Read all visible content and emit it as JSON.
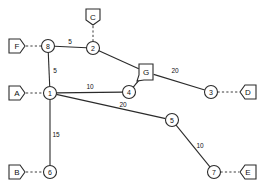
{
  "diagram": {
    "colors": {
      "background": "#ffffff",
      "edge": "#2b2b2b",
      "stub": "#3a3a3a",
      "node_fill": "#ffffff",
      "text": "#111111"
    },
    "nodes": [
      {
        "id": "n1",
        "label": "1",
        "x": 50,
        "y": 93,
        "r": 6.5
      },
      {
        "id": "n2",
        "label": "2",
        "x": 93,
        "y": 48,
        "r": 6.5
      },
      {
        "id": "n3",
        "label": "3",
        "x": 211,
        "y": 92,
        "r": 6.5
      },
      {
        "id": "n4",
        "label": "4",
        "x": 129,
        "y": 92,
        "r": 6.5
      },
      {
        "id": "n5",
        "label": "5",
        "x": 172,
        "y": 120,
        "r": 6.5
      },
      {
        "id": "n6",
        "label": "6",
        "x": 50,
        "y": 172,
        "r": 6.5
      },
      {
        "id": "n7",
        "label": "7",
        "x": 214,
        "y": 172,
        "r": 6.5
      },
      {
        "id": "n8",
        "label": "8",
        "x": 48,
        "y": 46,
        "r": 6.5
      }
    ],
    "terminals": [
      {
        "id": "tA",
        "label": "A",
        "x": 17,
        "y": 93,
        "orientation": "right",
        "attached_node": "n1"
      },
      {
        "id": "tB",
        "label": "B",
        "x": 17,
        "y": 172,
        "orientation": "right",
        "attached_node": "n6"
      },
      {
        "id": "tC",
        "label": "C",
        "x": 93,
        "y": 17,
        "orientation": "down",
        "attached_node": "n2"
      },
      {
        "id": "tD",
        "label": "D",
        "x": 248,
        "y": 92,
        "orientation": "left",
        "attached_node": "n3"
      },
      {
        "id": "tE",
        "label": "E",
        "x": 248,
        "y": 172,
        "orientation": "left",
        "attached_node": "n7"
      },
      {
        "id": "tF",
        "label": "F",
        "x": 17,
        "y": 46,
        "orientation": "right",
        "attached_node": "n8"
      },
      {
        "id": "tG",
        "label": "G",
        "x": 146,
        "y": 72,
        "orientation": "downleft",
        "attached_node": "n4"
      }
    ],
    "edges": [
      {
        "id": "e8-2",
        "from": "n8",
        "to": "n2",
        "weight": "5",
        "label_x": 70,
        "label_y": 41
      },
      {
        "id": "e8-1",
        "from": "n8",
        "to": "n1",
        "weight": "5",
        "label_x": 55,
        "label_y": 70
      },
      {
        "id": "e2-G",
        "from": "n2",
        "to": "tG",
        "weight": "",
        "label_x": 0,
        "label_y": 0
      },
      {
        "id": "eG-3",
        "from": "tG",
        "to": "n3",
        "weight": "20",
        "label_x": 175,
        "label_y": 70
      },
      {
        "id": "e1-4",
        "from": "n1",
        "to": "n4",
        "weight": "10",
        "label_x": 90,
        "label_y": 86
      },
      {
        "id": "e4-G",
        "from": "n4",
        "to": "tG",
        "weight": "",
        "label_x": 0,
        "label_y": 0
      },
      {
        "id": "e1-5",
        "from": "n1",
        "to": "n5",
        "weight": "20",
        "label_x": 123,
        "label_y": 104
      },
      {
        "id": "e1-6",
        "from": "n1",
        "to": "n6",
        "weight": "15",
        "label_x": 56,
        "label_y": 134
      },
      {
        "id": "e5-7",
        "from": "n5",
        "to": "n7",
        "weight": "10",
        "label_x": 200,
        "label_y": 145
      }
    ],
    "stubs": [
      {
        "id": "sA",
        "from": "tA",
        "to": "n1"
      },
      {
        "id": "sB",
        "from": "tB",
        "to": "n6"
      },
      {
        "id": "sC",
        "from": "tC",
        "to": "n2"
      },
      {
        "id": "sD",
        "from": "n3",
        "to": "tD"
      },
      {
        "id": "sE",
        "from": "n7",
        "to": "tE"
      },
      {
        "id": "sF",
        "from": "tF",
        "to": "n8"
      },
      {
        "id": "sG",
        "from": "n4",
        "to": "tG"
      }
    ]
  }
}
